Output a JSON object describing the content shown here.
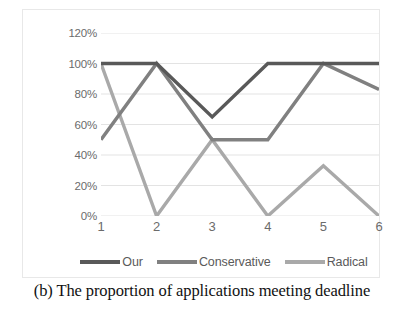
{
  "figure": {
    "caption": "(b) The proportion of applications meeting deadline"
  },
  "chart_data": {
    "type": "line",
    "title": "",
    "xlabel": "",
    "ylabel": "",
    "categories": [
      "1",
      "2",
      "3",
      "4",
      "5",
      "6"
    ],
    "x_tick_labels": [
      "1",
      "2",
      "3",
      "4",
      "5",
      "6"
    ],
    "y_tick_labels": [
      "0%",
      "20%",
      "40%",
      "60%",
      "80%",
      "100%",
      "120%"
    ],
    "y_tick_values": [
      0,
      20,
      40,
      60,
      80,
      100,
      120
    ],
    "ylim": [
      0,
      120
    ],
    "grid": true,
    "grid_axis": "y",
    "grid_color": "#e3e3e3",
    "legend_position": "bottom",
    "series": [
      {
        "name": "Our",
        "color": "#595959",
        "values": [
          100,
          100,
          65,
          100,
          100,
          100
        ]
      },
      {
        "name": "Conservative",
        "color": "#808080",
        "values": [
          50,
          100,
          50,
          50,
          100,
          83
        ]
      },
      {
        "name": "Radical",
        "color": "#a9a9a9",
        "values": [
          100,
          0,
          50,
          0,
          33,
          0
        ]
      }
    ]
  },
  "legend": {
    "items": [
      {
        "label": "Our",
        "color": "#595959"
      },
      {
        "label": "Conservative",
        "color": "#808080"
      },
      {
        "label": "Radical",
        "color": "#a9a9a9"
      }
    ]
  }
}
